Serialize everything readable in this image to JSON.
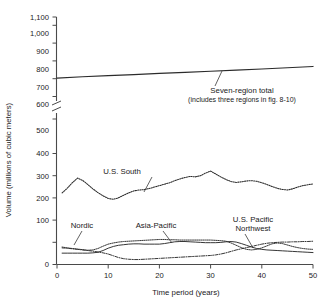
{
  "chart_data": {
    "type": "line",
    "title": "",
    "xlabel": "Time period (years)",
    "ylabel": "Volume (millions of cubic meters)",
    "xlim": [
      0,
      50
    ],
    "xticks": [
      0,
      10,
      20,
      30,
      40,
      50
    ],
    "xtick_labels": [
      "0",
      "10",
      "20",
      "30",
      "40",
      "50"
    ],
    "yticks": [
      0,
      100,
      200,
      300,
      400,
      500,
      600,
      700,
      800,
      900,
      1000,
      1100
    ],
    "ytick_labels": [
      "0",
      "100",
      "200",
      "300",
      "400",
      "500",
      "600",
      "700",
      "800",
      "900",
      "1,000",
      "1,100"
    ],
    "y_axis_break": {
      "present": true,
      "between": [
        500,
        600
      ]
    },
    "grid": false,
    "legend_position": "inline-annotations",
    "annotations": [
      {
        "name": "seven-region-total",
        "text": "Seven-region total",
        "subtext": "(includes three regions in fig. 8-10)"
      }
    ],
    "series": [
      {
        "name": "Seven-region total",
        "label": "Seven-region total",
        "style": "solid",
        "x": [
          0,
          5,
          10,
          15,
          20,
          25,
          30,
          35,
          40,
          45,
          50
        ],
        "values": [
          716,
          724,
          731,
          738,
          745,
          752,
          759,
          766,
          773,
          781,
          789
        ]
      },
      {
        "name": "U.S. South",
        "label": "U.S. South",
        "style": "dotted",
        "x": [
          1,
          2,
          3,
          4,
          5,
          6,
          7,
          8,
          9,
          10,
          11,
          12,
          13,
          14,
          15,
          16,
          17,
          18,
          19,
          20,
          21,
          22,
          23,
          24,
          25,
          26,
          27,
          28,
          29,
          30,
          31,
          32,
          33,
          34,
          35,
          36,
          37,
          38,
          39,
          40,
          41,
          42,
          43,
          44,
          45,
          46,
          47,
          48,
          49,
          50
        ],
        "values": [
          246,
          262,
          281,
          297,
          289,
          275,
          260,
          247,
          236,
          227,
          224,
          229,
          238,
          246,
          253,
          256,
          257,
          261,
          266,
          271,
          276,
          281,
          288,
          294,
          299,
          303,
          301,
          305,
          314,
          321,
          311,
          301,
          292,
          285,
          282,
          284,
          287,
          288,
          286,
          281,
          275,
          268,
          262,
          258,
          256,
          260,
          266,
          271,
          274,
          277
        ]
      },
      {
        "name": "Nordic",
        "label": "Nordic",
        "style": "dotted-fine",
        "x": [
          1,
          2,
          3,
          4,
          5,
          6,
          7,
          8,
          9,
          10,
          11,
          12,
          13,
          14,
          15,
          16,
          17,
          18,
          19,
          20,
          21,
          22,
          23,
          24,
          25,
          26,
          27,
          28,
          29,
          30,
          31,
          32,
          33,
          34,
          35,
          36,
          37,
          38,
          39,
          40,
          41,
          42,
          43,
          44,
          45,
          46,
          47,
          48,
          49,
          50
        ],
        "values": [
          60,
          57,
          55,
          53,
          51,
          49,
          50,
          55,
          63,
          70,
          74,
          77,
          79,
          80,
          81,
          82,
          83,
          84,
          85,
          86,
          86,
          85,
          85,
          84,
          84,
          84,
          84,
          84,
          84,
          84,
          83,
          82,
          80,
          74,
          66,
          58,
          52,
          50,
          52,
          57,
          64,
          71,
          74,
          72,
          67,
          62,
          58,
          55,
          53,
          52
        ]
      },
      {
        "name": "Asia-Pacific",
        "label": "Asia-Pacific",
        "style": "solid-thin",
        "x": [
          1,
          2,
          3,
          4,
          5,
          6,
          7,
          8,
          9,
          10,
          11,
          12,
          13,
          14,
          15,
          16,
          17,
          18,
          19,
          20,
          21,
          22,
          23,
          24,
          25,
          26,
          27,
          28,
          29,
          30,
          31,
          32,
          33,
          34,
          35,
          36,
          37,
          38,
          39,
          40,
          41,
          42,
          43,
          44,
          45,
          46,
          47,
          48,
          49,
          50
        ],
        "values": [
          39,
          39,
          39,
          39,
          39,
          39,
          40,
          42,
          48,
          56,
          62,
          66,
          68,
          70,
          71,
          71,
          70,
          70,
          70,
          70,
          72,
          75,
          78,
          79,
          79,
          78,
          77,
          76,
          75,
          75,
          75,
          76,
          78,
          79,
          77,
          72,
          66,
          60,
          55,
          52,
          50,
          49,
          48,
          47,
          46,
          45,
          44,
          43,
          42,
          41
        ]
      },
      {
        "name": "U.S. Pacific Northwest",
        "label": "U.S. Pacific Northwest",
        "style": "dash-dot",
        "x": [
          1,
          2,
          3,
          4,
          5,
          6,
          7,
          8,
          9,
          10,
          11,
          12,
          13,
          14,
          15,
          16,
          17,
          18,
          19,
          20,
          21,
          22,
          23,
          24,
          25,
          26,
          27,
          28,
          29,
          30,
          31,
          32,
          33,
          34,
          35,
          36,
          37,
          38,
          39,
          40,
          41,
          42,
          43,
          44,
          45,
          46,
          47,
          48,
          49,
          50
        ],
        "values": [
          57,
          56,
          54,
          52,
          50,
          48,
          46,
          43,
          40,
          36,
          30,
          24,
          20,
          18,
          17,
          17,
          18,
          19,
          20,
          21,
          22,
          23,
          24,
          25,
          26,
          27,
          28,
          29,
          30,
          31,
          33,
          36,
          40,
          45,
          50,
          54,
          58,
          62,
          66,
          70,
          73,
          75,
          76,
          77,
          77,
          78,
          78,
          79,
          79,
          80
        ]
      }
    ]
  }
}
